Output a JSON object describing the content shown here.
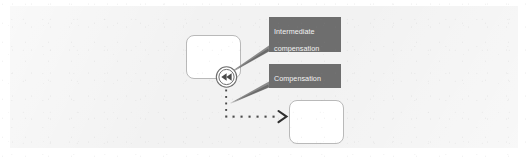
{
  "figure": {
    "kind": "bpmn-diagram-excerpt",
    "background_color": "#f2f2f2",
    "page_color": "#ffffff"
  },
  "callouts": [
    {
      "id": "intermediate-compensation-boundary-event",
      "text": "Intermediate\ncompensation\nboundary event",
      "lines": [
        "Intermediate",
        "compensation",
        "boundary event"
      ],
      "box_color": "#6e6e6e",
      "text_color": "#f3f3f3"
    },
    {
      "id": "compensation-association",
      "text": "Compensation\nassociation",
      "lines": [
        "Compensation",
        "association"
      ],
      "box_color": "#6e6e6e",
      "text_color": "#f3f3f3"
    }
  ],
  "shapes": {
    "task_source": {
      "label": "",
      "fill": "#ffffff",
      "stroke": "#b9b9b9"
    },
    "task_target": {
      "label": "",
      "fill": "#ffffff",
      "stroke": "#b9b9b9"
    },
    "boundary_event": {
      "icon": "compensation-rewind-icon",
      "marker": "double-left-triangle",
      "stroke": "#6e6e6e",
      "type": "intermediate-boundary"
    },
    "association": {
      "style": "dotted",
      "arrow": "open-chevron",
      "stroke": "#4a4a4a"
    }
  }
}
